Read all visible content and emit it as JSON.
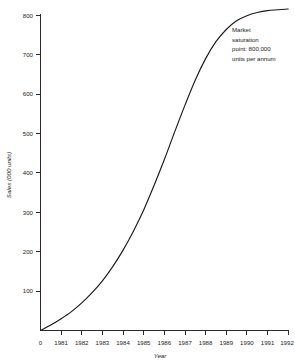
{
  "chart_data": {
    "type": "line",
    "title": "",
    "xlabel": "Year",
    "ylabel": "Sales (000 units)",
    "xlim": [
      1980,
      1992
    ],
    "ylim": [
      0,
      840
    ],
    "grid": false,
    "legend": "none",
    "x_tick_labels": [
      "0",
      "1981",
      "1982",
      "1983",
      "1984",
      "1985",
      "1986",
      "1987",
      "1988",
      "1989",
      "1990",
      "1991",
      "1992"
    ],
    "y_tick_labels": [
      "100",
      "200",
      "300",
      "400",
      "500",
      "600",
      "700",
      "800"
    ],
    "y_tick_values": [
      100,
      200,
      300,
      400,
      500,
      600,
      700,
      800
    ],
    "series": [
      {
        "name": "Sales",
        "x": [
          1980,
          1980.5,
          1981,
          1981.5,
          1982,
          1982.5,
          1983,
          1983.5,
          1984,
          1984.5,
          1985,
          1985.5,
          1986,
          1986.5,
          1987,
          1987.5,
          1988,
          1988.5,
          1989,
          1989.5,
          1990,
          1990.5,
          1991,
          1991.5,
          1992
        ],
        "values": [
          0,
          14,
          30,
          48,
          70,
          96,
          126,
          162,
          204,
          252,
          306,
          368,
          434,
          504,
          572,
          636,
          690,
          733,
          764,
          786,
          799,
          807,
          812,
          814,
          816
        ]
      }
    ],
    "annotations": [
      {
        "name": "market-saturation-note",
        "lines": [
          "Market",
          "saturation",
          "point: 800,000",
          "units per annum"
        ],
        "x": 1989.1,
        "y": 790
      }
    ]
  },
  "annotation": {
    "line1": "Market",
    "line2": "saturation",
    "line3": "point: 800,000",
    "line4": "units per annum"
  },
  "axes": {
    "y_title": "Sales (000 units)",
    "x_title": "Year",
    "x_ticks": {
      "t0": "0",
      "t1": "1981",
      "t2": "1982",
      "t3": "1983",
      "t4": "1984",
      "t5": "1985",
      "t6": "1986",
      "t7": "1987",
      "t8": "1988",
      "t9": "1989",
      "t10": "1990",
      "t11": "1991",
      "t12": "1992"
    },
    "y_ticks": {
      "t100": "100",
      "t200": "200",
      "t300": "300",
      "t400": "400",
      "t500": "500",
      "t600": "600",
      "t700": "700",
      "t800": "800"
    }
  },
  "colors": {
    "line": "#1a1a1a",
    "axis": "#2b2b2b",
    "background": "#ffffff",
    "text": "#1a1a1a"
  }
}
